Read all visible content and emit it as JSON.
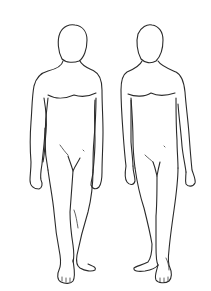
{
  "image": {
    "description": "Line drawing of two standing male human figure outlines, front view, side by side",
    "background": "#ffffff",
    "line_color": "#2b2b2b",
    "figures": [
      {
        "name": "left-figure",
        "pose": "standing, front view, right foot turned outward"
      },
      {
        "name": "right-figure",
        "pose": "standing, front view, left foot turned outward"
      }
    ]
  }
}
